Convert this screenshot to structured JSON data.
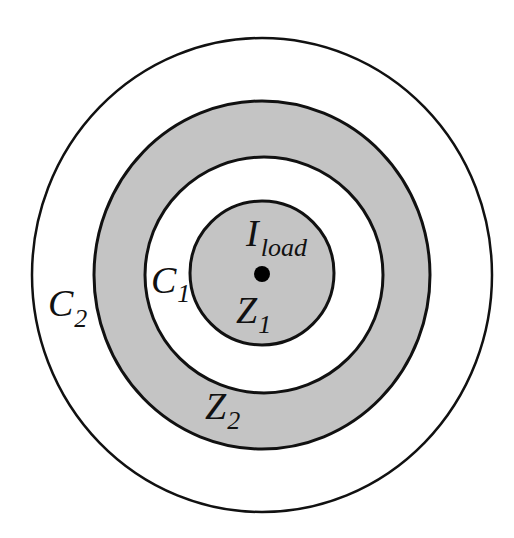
{
  "diagram": {
    "type": "concentric-regions",
    "colors": {
      "background": "#ffffff",
      "shaded": "#c4c4c4",
      "stroke": "#111111",
      "dot": "#000000"
    },
    "center": {
      "x": 262,
      "y": 275
    },
    "regions": [
      {
        "id": "C2",
        "fill": "white",
        "rx": 230,
        "ry": 237
      },
      {
        "id": "Z2",
        "fill": "gray",
        "rx": 168,
        "ry": 174
      },
      {
        "id": "C1",
        "fill": "white",
        "rx": 119,
        "ry": 118
      },
      {
        "id": "Z1",
        "fill": "gray",
        "rx": 72,
        "ry": 72
      }
    ],
    "labels": {
      "i_load": {
        "main": "I",
        "sub": "load"
      },
      "z1": {
        "main": "Z",
        "sub": "1"
      },
      "c1": {
        "main": "C",
        "sub": "1"
      },
      "c2": {
        "main": "C",
        "sub": "2"
      },
      "z2": {
        "main": "Z",
        "sub": "2"
      }
    },
    "load_point": {
      "x": 262,
      "y": 274,
      "r": 8
    }
  }
}
